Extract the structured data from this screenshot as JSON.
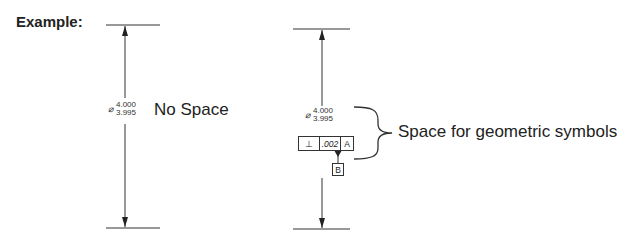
{
  "header": {
    "title": "Example:"
  },
  "left_example": {
    "diameter_symbol": "⌀",
    "upper_limit": "4.000",
    "lower_limit": "3.995",
    "caption": "No Space"
  },
  "right_example": {
    "diameter_symbol": "⌀",
    "upper_limit": "4.000",
    "lower_limit": "3.995",
    "feature_control_frame": {
      "symbol": "⊥",
      "tolerance": ".002",
      "datum_ref": "A"
    },
    "datum_feature": "B",
    "caption": "Space for geometric symbols"
  }
}
